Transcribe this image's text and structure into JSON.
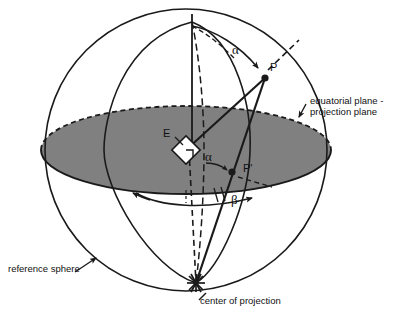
{
  "figure": {
    "background_color": "#ffffff",
    "line_color": "#1a1a1a",
    "disc_fill_color": "#808080",
    "marker_fill_color": "#ffffff"
  },
  "labels": {
    "equatorial_plane_line1": "equatorial plane -",
    "equatorial_plane_line2": "projection plane",
    "reference_sphere": "reference sphere",
    "center_of_projection": "center of projection",
    "sphere_center": "E",
    "point_on_sphere": "P",
    "projected_point": "P'",
    "angle_alpha_upper": "α",
    "angle_alpha_lower": "α",
    "angle_beta": "β"
  },
  "geometry": {
    "sphere_center_px": {
      "x": 186,
      "y": 150
    },
    "sphere_radius_px": 141,
    "north_pole_px": {
      "x": 192,
      "y": 22
    },
    "south_pole_px": {
      "x": 196,
      "y": 283
    },
    "point_P_px": {
      "x": 265,
      "y": 78
    },
    "point_P_prime_px": {
      "x": 232,
      "y": 172
    },
    "equator_ellipse_rx_px": 145,
    "equator_ellipse_ry_px": 44
  },
  "icons": {
    "center_of_projection_marker": "starburst-icon",
    "sphere_center_marker": "diamond-right-angle-icon",
    "point_marker": "filled-dot-icon",
    "leader_arrow": "arrow-icon",
    "angle_arc_arrow": "curved-arrow-icon"
  }
}
